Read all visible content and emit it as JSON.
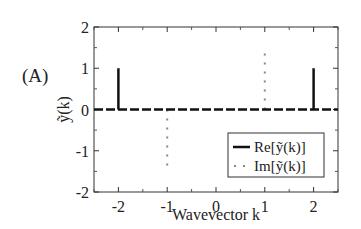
{
  "panel_label": "(A)",
  "chart_data": {
    "type": "line",
    "title": "",
    "panel": "(A)",
    "xlabel": "Wavevector k",
    "ylabel": "ỹ(k)",
    "xlim": [
      -2.5,
      2.5
    ],
    "ylim": [
      -2,
      2
    ],
    "xticks": [
      -2,
      -1,
      0,
      1,
      2
    ],
    "yticks": [
      -2,
      -1,
      0,
      1,
      2
    ],
    "xtick_labels": [
      "-2",
      "-1",
      "0",
      "1",
      "2"
    ],
    "ytick_labels": [
      "-2",
      "-1",
      "0",
      "1",
      "2"
    ],
    "grid": false,
    "legend_position": "lower right",
    "series": [
      {
        "name": "Re[ỹ(k)]",
        "style": "solid",
        "color": "#111111",
        "x": [
          -2.5,
          -2,
          -2,
          -2,
          2,
          2,
          2,
          2.5
        ],
        "y": [
          0,
          0,
          1,
          0,
          0,
          1,
          0,
          0
        ],
        "spikes": [
          {
            "k": -2,
            "value": 1
          },
          {
            "k": 2,
            "value": 1
          }
        ]
      },
      {
        "name": "Im[ỹ(k)]",
        "style": "dotted",
        "color": "#888888",
        "x": [
          -1,
          -1,
          1,
          1
        ],
        "y": [
          0,
          -1.45,
          0,
          1.45
        ],
        "spikes": [
          {
            "k": -1,
            "value": -1.45
          },
          {
            "k": 1,
            "value": 1.45
          }
        ]
      }
    ],
    "zero_line": {
      "style": "dashed",
      "color": "#111111",
      "value": 0
    }
  },
  "legend": {
    "items": [
      {
        "label": "Re[ỹ(k)]",
        "style": "solid"
      },
      {
        "label": "Im[ỹ(k)]",
        "style": "dotted"
      }
    ]
  },
  "axes": {
    "xlabel": "Wavevector k",
    "ylabel": "ỹ(k)"
  }
}
